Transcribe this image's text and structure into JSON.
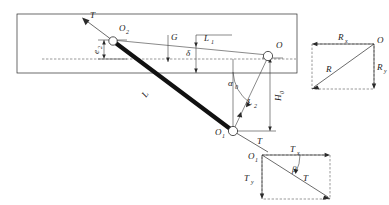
{
  "figure": {
    "background_color": "#ffffff",
    "line_color": "#2b2b2b",
    "bar_color": "#111111",
    "dash_color": "#555555"
  },
  "labels": {
    "T_top": "T",
    "T_top_sub": "",
    "O2": "O",
    "O2_sub": "2",
    "e2": "e",
    "e2_sub": "2",
    "G": "G",
    "delta": "δ",
    "L1": "L",
    "L1_sub": "1",
    "O_main": "O",
    "alpha0": "α",
    "alpha0_sub": "0",
    "L2": "L",
    "L2_sub": "2",
    "H0": "H",
    "H0_sub": "0",
    "L_bar": "L",
    "O1": "O",
    "O1_sub": "1",
    "T_lower": "T"
  },
  "triangle_right": {
    "name": "reaction-force-triangle",
    "Rx": "R",
    "Rx_sub": "x",
    "Ry": "R",
    "Ry_sub": "y",
    "R": "R",
    "vertex": "O"
  },
  "triangle_bottom": {
    "name": "tension-force-triangle",
    "Tx": "T",
    "Tx_sub": "x",
    "Ty": "T",
    "Ty_sub": "y",
    "T": "T",
    "beta": "β",
    "vertex": "O",
    "vertex_sub": "1"
  }
}
